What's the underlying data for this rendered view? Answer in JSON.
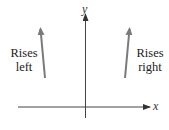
{
  "diagram": {
    "axes": {
      "x_label": "x",
      "y_label": "y",
      "axis_color": "#444444"
    },
    "annotations": [
      {
        "id": "left",
        "line1": "Rises",
        "line2": "left"
      },
      {
        "id": "right",
        "line1": "Rises",
        "line2": "right"
      }
    ],
    "arrow_color": "#7a7a7a"
  }
}
